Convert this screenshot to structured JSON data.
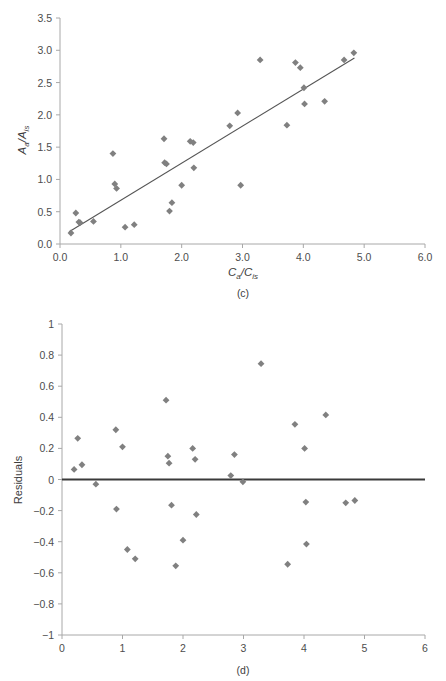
{
  "figure": {
    "width": 446,
    "height": 681,
    "background": "#ffffff",
    "marker_color": "#808080",
    "axis_color": "#a8a8a8",
    "line_color": "#555555",
    "zero_line_color": "#3a3a3a"
  },
  "panel_c": {
    "label": "(c)",
    "ylabel_main": "A",
    "ylabel_sub1": "a",
    "ylabel_mid": "/A",
    "ylabel_sub2": "is",
    "xlabel_main": "C",
    "xlabel_sub1": "a",
    "xlabel_mid": "/C",
    "xlabel_sub2": "is",
    "x_ticks": [
      "0.0",
      "1.0",
      "2.0",
      "3.0",
      "4.0",
      "5.0",
      "6.0"
    ],
    "y_ticks": [
      "0.0",
      "0.5",
      "1.0",
      "1.5",
      "2.0",
      "2.5",
      "3.0",
      "3.5"
    ]
  },
  "panel_d": {
    "label": "(d)",
    "ylabel": "Residuals",
    "x_ticks": [
      "0",
      "1",
      "2",
      "3",
      "4",
      "5",
      "6"
    ],
    "y_ticks": [
      "1",
      "0.8",
      "0.6",
      "0.4",
      "0.2",
      "0",
      "−0.2",
      "−0.4",
      "−0.6",
      "−0.8",
      "−1"
    ]
  },
  "chart_data": [
    {
      "type": "scatter",
      "title": "(c)",
      "xlabel": "Ca/Cis",
      "ylabel": "Aa/Ais",
      "xlim": [
        0.0,
        6.0
      ],
      "ylim": [
        0.0,
        3.5
      ],
      "xticks": [
        0.0,
        1.0,
        2.0,
        3.0,
        4.0,
        5.0,
        6.0
      ],
      "yticks": [
        0.0,
        0.5,
        1.0,
        1.5,
        2.0,
        2.5,
        3.0,
        3.5
      ],
      "grid": false,
      "legend": "none",
      "marker": "diamond",
      "points": [
        {
          "x": 0.18,
          "y": 0.17
        },
        {
          "x": 0.26,
          "y": 0.48
        },
        {
          "x": 0.31,
          "y": 0.34
        },
        {
          "x": 0.33,
          "y": 0.33
        },
        {
          "x": 0.55,
          "y": 0.35
        },
        {
          "x": 0.87,
          "y": 1.4
        },
        {
          "x": 0.9,
          "y": 0.93
        },
        {
          "x": 0.93,
          "y": 0.86
        },
        {
          "x": 1.07,
          "y": 0.26
        },
        {
          "x": 1.22,
          "y": 0.3
        },
        {
          "x": 1.71,
          "y": 1.63
        },
        {
          "x": 1.72,
          "y": 1.26
        },
        {
          "x": 1.75,
          "y": 1.24
        },
        {
          "x": 1.8,
          "y": 0.51
        },
        {
          "x": 1.84,
          "y": 0.64
        },
        {
          "x": 2.0,
          "y": 0.91
        },
        {
          "x": 2.14,
          "y": 1.59
        },
        {
          "x": 2.19,
          "y": 1.57
        },
        {
          "x": 2.2,
          "y": 1.18
        },
        {
          "x": 2.79,
          "y": 1.83
        },
        {
          "x": 2.92,
          "y": 2.03
        },
        {
          "x": 2.97,
          "y": 0.91
        },
        {
          "x": 3.29,
          "y": 2.85
        },
        {
          "x": 3.73,
          "y": 1.84
        },
        {
          "x": 3.87,
          "y": 2.81
        },
        {
          "x": 3.95,
          "y": 2.73
        },
        {
          "x": 4.01,
          "y": 2.42
        },
        {
          "x": 4.02,
          "y": 2.17
        },
        {
          "x": 4.35,
          "y": 2.21
        },
        {
          "x": 4.67,
          "y": 2.85
        },
        {
          "x": 4.83,
          "y": 2.96
        }
      ],
      "trendline": {
        "x0": 0.15,
        "y0": 0.19,
        "x1": 4.84,
        "y1": 2.88
      }
    },
    {
      "type": "scatter",
      "title": "(d)",
      "xlabel": "",
      "ylabel": "Residuals",
      "xlim": [
        0,
        6
      ],
      "ylim": [
        -1,
        1
      ],
      "xticks": [
        0,
        1,
        2,
        3,
        4,
        5,
        6
      ],
      "yticks": [
        -1,
        -0.8,
        -0.6,
        -0.4,
        -0.2,
        0,
        0.2,
        0.4,
        0.6,
        0.8,
        1
      ],
      "grid": false,
      "legend": "none",
      "marker": "diamond",
      "reference_line": 0,
      "points": [
        {
          "x": 0.2,
          "y": 0.065
        },
        {
          "x": 0.26,
          "y": 0.265
        },
        {
          "x": 0.33,
          "y": 0.095
        },
        {
          "x": 0.56,
          "y": -0.03
        },
        {
          "x": 0.89,
          "y": 0.32
        },
        {
          "x": 0.9,
          "y": -0.19
        },
        {
          "x": 1.0,
          "y": 0.21
        },
        {
          "x": 1.08,
          "y": -0.45
        },
        {
          "x": 1.21,
          "y": -0.51
        },
        {
          "x": 1.72,
          "y": 0.51
        },
        {
          "x": 1.75,
          "y": 0.15
        },
        {
          "x": 1.77,
          "y": 0.105
        },
        {
          "x": 1.81,
          "y": -0.165
        },
        {
          "x": 1.88,
          "y": -0.555
        },
        {
          "x": 2.0,
          "y": -0.39
        },
        {
          "x": 2.16,
          "y": 0.2
        },
        {
          "x": 2.2,
          "y": 0.13
        },
        {
          "x": 2.22,
          "y": -0.225
        },
        {
          "x": 2.79,
          "y": 0.025
        },
        {
          "x": 2.85,
          "y": 0.16
        },
        {
          "x": 2.99,
          "y": -0.015
        },
        {
          "x": 3.29,
          "y": 0.745
        },
        {
          "x": 3.73,
          "y": -0.545
        },
        {
          "x": 3.85,
          "y": 0.355
        },
        {
          "x": 4.01,
          "y": 0.2
        },
        {
          "x": 4.03,
          "y": -0.145
        },
        {
          "x": 4.04,
          "y": -0.415
        },
        {
          "x": 4.36,
          "y": 0.415
        },
        {
          "x": 4.69,
          "y": -0.15
        },
        {
          "x": 4.84,
          "y": -0.135
        }
      ]
    }
  ]
}
